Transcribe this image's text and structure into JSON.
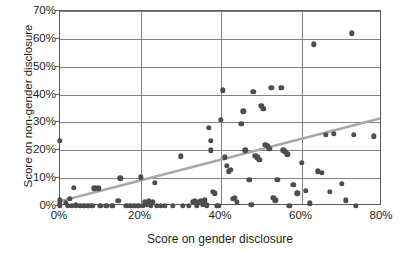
{
  "chart_data": {
    "type": "scatter",
    "title": "",
    "xlabel": "Score on gender disclosure",
    "ylabel": "Score on non-gender disclosure",
    "xlim": [
      0,
      80
    ],
    "ylim": [
      0,
      70
    ],
    "xticks": [
      "0%",
      "20%",
      "40%",
      "60%",
      "80%"
    ],
    "xtick_values": [
      0,
      20,
      40,
      60,
      80
    ],
    "yticks": [
      "0%",
      "10%",
      "20%",
      "30%",
      "40%",
      "50%",
      "60%",
      "70%"
    ],
    "ytick_values": [
      0,
      10,
      20,
      30,
      40,
      50,
      60,
      70
    ],
    "grid": true,
    "legend": false,
    "marker_color": "#4d4d4d",
    "grid_color": "#808285",
    "trendline": {
      "color": "#a7a9ac",
      "x_start": 0,
      "y_start": 1,
      "x_end": 80,
      "y_end": 31
    },
    "points": [
      [
        0,
        23.5
      ],
      [
        0,
        2.0
      ],
      [
        0,
        0.8
      ],
      [
        0,
        0.0
      ],
      [
        1.5,
        1.2
      ],
      [
        2.0,
        0.0
      ],
      [
        2.5,
        2.5
      ],
      [
        3.0,
        0.0
      ],
      [
        3.5,
        6.5
      ],
      [
        4.0,
        0.3
      ],
      [
        5.0,
        0.0
      ],
      [
        6.0,
        0.0
      ],
      [
        7.0,
        0.0
      ],
      [
        8.0,
        0.0
      ],
      [
        8.5,
        6.3
      ],
      [
        9.5,
        6.3
      ],
      [
        10.0,
        0.0
      ],
      [
        11.5,
        0.0
      ],
      [
        13.0,
        0.0
      ],
      [
        14.5,
        1.8
      ],
      [
        15.0,
        10.0
      ],
      [
        16.5,
        0.0
      ],
      [
        17.5,
        0.0
      ],
      [
        18.5,
        0.0
      ],
      [
        19.5,
        0.0
      ],
      [
        20.0,
        10.3
      ],
      [
        20.5,
        0.0
      ],
      [
        21.0,
        1.5
      ],
      [
        21.5,
        0.5
      ],
      [
        22.0,
        1.8
      ],
      [
        22.5,
        0.2
      ],
      [
        23.0,
        1.6
      ],
      [
        23.5,
        8.3
      ],
      [
        24.0,
        0.0
      ],
      [
        25.0,
        0.0
      ],
      [
        26.0,
        0.0
      ],
      [
        28.0,
        0.0
      ],
      [
        30.0,
        17.8
      ],
      [
        30.5,
        0.0
      ],
      [
        32.0,
        0.0
      ],
      [
        33.0,
        1.6
      ],
      [
        33.5,
        1.8
      ],
      [
        34.0,
        0.3
      ],
      [
        34.5,
        1.5
      ],
      [
        35.0,
        1.9
      ],
      [
        35.5,
        0.4
      ],
      [
        36.0,
        2.0
      ],
      [
        36.5,
        0.2
      ],
      [
        37.0,
        28.0
      ],
      [
        37.5,
        23.5
      ],
      [
        37.5,
        20.0
      ],
      [
        38.0,
        5.0
      ],
      [
        38.5,
        4.5
      ],
      [
        39.0,
        0.0
      ],
      [
        39.5,
        0.0
      ],
      [
        40.0,
        31.0
      ],
      [
        40.5,
        41.5
      ],
      [
        41.0,
        17.5
      ],
      [
        41.5,
        14.5
      ],
      [
        42.0,
        12.5
      ],
      [
        42.5,
        13.0
      ],
      [
        43.0,
        2.5
      ],
      [
        43.5,
        3.0
      ],
      [
        44.0,
        1.5
      ],
      [
        45.0,
        29.5
      ],
      [
        45.5,
        34.0
      ],
      [
        46.0,
        20.0
      ],
      [
        47.0,
        9.5
      ],
      [
        47.5,
        0.5
      ],
      [
        48.0,
        41.0
      ],
      [
        48.5,
        18.0
      ],
      [
        49.0,
        17.5
      ],
      [
        49.5,
        16.5
      ],
      [
        50.0,
        36.0
      ],
      [
        50.5,
        35.0
      ],
      [
        51.0,
        22.0
      ],
      [
        51.5,
        21.5
      ],
      [
        52.0,
        20.5
      ],
      [
        52.5,
        42.5
      ],
      [
        53.0,
        3.0
      ],
      [
        53.5,
        2.0
      ],
      [
        54.0,
        9.5
      ],
      [
        55.0,
        42.5
      ],
      [
        55.5,
        20.0
      ],
      [
        56.0,
        19.5
      ],
      [
        56.5,
        18.5
      ],
      [
        57.0,
        0.0
      ],
      [
        58.0,
        7.5
      ],
      [
        59.0,
        4.5
      ],
      [
        60.0,
        15.5
      ],
      [
        61.0,
        5.5
      ],
      [
        62.0,
        1.0
      ],
      [
        63.0,
        58.0
      ],
      [
        64.0,
        12.5
      ],
      [
        65.0,
        12.0
      ],
      [
        66.0,
        25.5
      ],
      [
        67.0,
        5.0
      ],
      [
        68.0,
        26.0
      ],
      [
        70.0,
        8.0
      ],
      [
        71.0,
        2.0
      ],
      [
        72.5,
        62.0
      ],
      [
        73.0,
        25.5
      ],
      [
        73.5,
        0.0
      ],
      [
        78.0,
        25.0
      ]
    ]
  }
}
